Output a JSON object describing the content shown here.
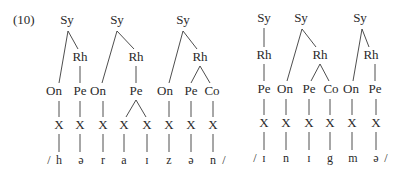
{
  "example_label": "(10)",
  "node_labels": {
    "syllable": "Sy",
    "rhyme": "Rh",
    "onset": "On",
    "peak": "Pe",
    "coda": "Co",
    "timing_slot": "X"
  },
  "words": [
    {
      "name": "horizon",
      "segments_display": "/ h ə r a ɪ z ə n /",
      "syllables": [
        {
          "structure": "On-Rh(Pe)",
          "onset": [
            "h"
          ],
          "peak": [
            "ə"
          ],
          "coda": []
        },
        {
          "structure": "On-Rh(Pe branching)",
          "onset": [
            "r"
          ],
          "peak": [
            "a",
            "ɪ"
          ],
          "coda": []
        },
        {
          "structure": "On-Rh(Pe,Co)",
          "onset": [
            "z"
          ],
          "peak": [
            "ə"
          ],
          "coda": [
            "n"
          ]
        }
      ]
    },
    {
      "name": "enigma",
      "segments_display": "/ ɪ n ɪ g m ə /",
      "syllables": [
        {
          "structure": "Rh(Pe)",
          "onset": [],
          "peak": [
            "ɪ"
          ],
          "coda": []
        },
        {
          "structure": "On-Rh(Pe,Co)",
          "onset": [
            "n"
          ],
          "peak": [
            "ɪ"
          ],
          "coda": [
            "g"
          ]
        },
        {
          "structure": "On-Rh(Pe)",
          "onset": [
            "m"
          ],
          "peak": [
            "ə"
          ],
          "coda": []
        }
      ]
    }
  ],
  "segments": {
    "w1": [
      "/",
      "h",
      "ə",
      "r",
      "a",
      "ɪ",
      "z",
      "ə",
      "n",
      "/"
    ],
    "w2": [
      "/",
      "ɪ",
      "n",
      "ɪ",
      "g",
      "m",
      "ə",
      "/"
    ]
  }
}
